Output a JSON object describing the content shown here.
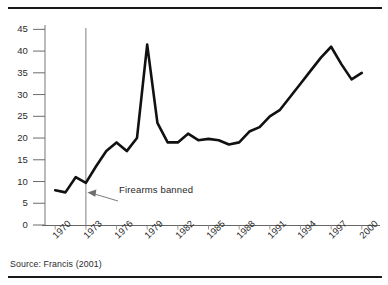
{
  "figure": {
    "source_note": "Source: Francis (2001)",
    "annotation": {
      "label": "Firearms banned",
      "year": 1973
    }
  },
  "chart_data": {
    "type": "line",
    "title": "",
    "subtitle": "",
    "xlabel": "",
    "ylabel": "",
    "xlim": [
      1969,
      2001
    ],
    "ylim": [
      0,
      46
    ],
    "grid": false,
    "legend": "none",
    "line_color": "#111111",
    "axis_color": "#555555",
    "marker_line_color": "#8a8a8a",
    "ytick_labels": [
      "0",
      "5",
      "10",
      "15",
      "20",
      "25",
      "30",
      "35",
      "40",
      "45"
    ],
    "ytick_values": [
      0,
      5,
      10,
      15,
      20,
      25,
      30,
      35,
      40,
      45
    ],
    "xtick_labels": [
      "1970",
      "1973",
      "1976",
      "1979",
      "1982",
      "1985",
      "1988",
      "1991",
      "1994",
      "1997",
      "2000"
    ],
    "xtick_values": [
      1970,
      1973,
      1976,
      1979,
      1982,
      1985,
      1988,
      1991,
      1994,
      1997,
      2000
    ],
    "x": [
      1970,
      1971,
      1972,
      1973,
      1974,
      1975,
      1976,
      1977,
      1978,
      1979,
      1980,
      1981,
      1982,
      1983,
      1984,
      1985,
      1986,
      1987,
      1988,
      1989,
      1990,
      1991,
      1992,
      1993,
      1994,
      1995,
      1996,
      1997,
      1998,
      1999,
      2000
    ],
    "values": [
      8.0,
      7.5,
      11.0,
      9.7,
      13.5,
      17.0,
      19.0,
      17.0,
      20.0,
      41.5,
      23.5,
      19.0,
      19.0,
      21.0,
      19.5,
      19.8,
      19.5,
      18.5,
      19.0,
      21.5,
      22.5,
      25.0,
      26.5,
      29.5,
      32.5,
      35.5,
      38.5,
      41.0,
      37.0,
      33.5,
      35.0
    ],
    "annotations": [
      {
        "text": "Firearms banned",
        "x": 1973,
        "kind": "vertical-line-with-arrow"
      }
    ]
  }
}
